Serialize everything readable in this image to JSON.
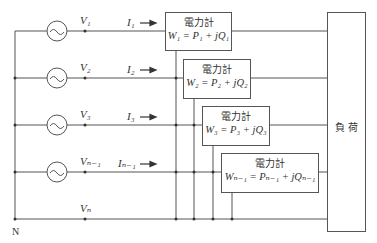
{
  "diagram": {
    "neutral_label": "N",
    "load_label": "負 荷",
    "voltages": [
      "V₁",
      "V₂",
      "V₃",
      "Vₙ₋₁",
      "Vₙ"
    ],
    "currents": [
      "I₁",
      "I₂",
      "I₃",
      "Iₙ₋₁"
    ],
    "meters": [
      {
        "name": "電力計",
        "formula": "W₁ = P₁ + jQ₁"
      },
      {
        "name": "電力計",
        "formula": "W₂ = P₂ + jQ₂"
      },
      {
        "name": "電力計",
        "formula": "W₃ = P₃ + jQ₃"
      },
      {
        "name": "電力計",
        "formula": "Wₙ₋₁ = Pₙ₋₁ + jQₙ₋₁"
      }
    ],
    "sources": [
      "~",
      "~",
      "~",
      "~"
    ]
  }
}
